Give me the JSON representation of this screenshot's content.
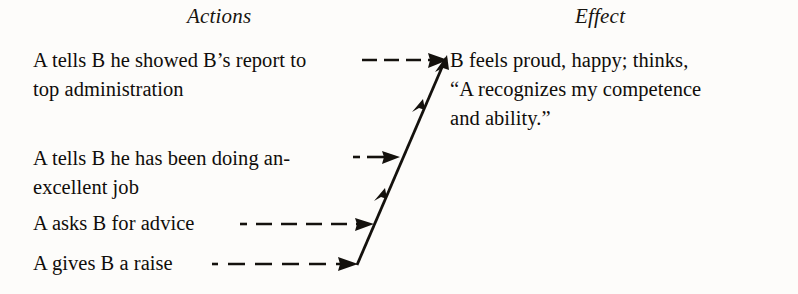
{
  "figure": {
    "type": "diagram",
    "kind": "two-column-flow",
    "background_color": "#fdfcfa",
    "ink_color": "#14110d"
  },
  "headings": {
    "actions": "Actions",
    "effect": "Effect"
  },
  "actions": [
    {
      "id": "row1",
      "text": "A tells B he showed B’s report to\ntop administration",
      "connector": "dashed-arrow"
    },
    {
      "id": "row2",
      "text": "A tells B he has been doing an-\nexcellent job",
      "connector": "dashed-arrow"
    },
    {
      "id": "row3",
      "text": "A asks B for advice",
      "connector": "dashed-arrow"
    },
    {
      "id": "row4",
      "text": "A gives B a raise",
      "connector": "dashed-arrow"
    }
  ],
  "effect": {
    "text": "B feels proud, happy; thinks,\n“A recognizes my competence\nand ability.”"
  },
  "connectors": {
    "spine_label": "diagonal-spine-arrow",
    "arrowheads_on_spine": 3,
    "dashed_feeders": 4
  }
}
